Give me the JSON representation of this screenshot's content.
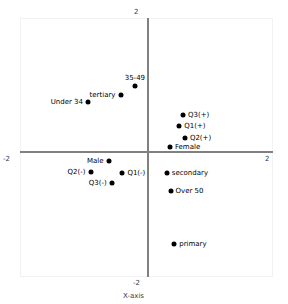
{
  "chart_data": {
    "type": "scatter",
    "title": "",
    "xlabel": "X-axis",
    "ylabel": "Y-axis",
    "xlim": [
      -2,
      2
    ],
    "ylim": [
      -2,
      2
    ],
    "xticks": [
      "-2",
      "2"
    ],
    "yticks": [
      "-2",
      "2"
    ],
    "grid": false,
    "legend": "none",
    "marker_color": "#000000",
    "axis_color": "#808080",
    "points": [
      {
        "label": "35-49",
        "x": -0.21,
        "y": 1.0,
        "label_pos": "above"
      },
      {
        "label": "tertiary",
        "x": -0.44,
        "y": 0.86,
        "label_pos": "left"
      },
      {
        "label": "Under 34",
        "x": -0.96,
        "y": 0.75,
        "label_pos": "left"
      },
      {
        "label": "Q3(+)",
        "x": 0.56,
        "y": 0.55,
        "label_pos": "right"
      },
      {
        "label": "Q1(+)",
        "x": 0.5,
        "y": 0.39,
        "label_pos": "right"
      },
      {
        "label": "Q2(+)",
        "x": 0.59,
        "y": 0.21,
        "label_pos": "right"
      },
      {
        "label": "Female",
        "x": 0.35,
        "y": 0.08,
        "label_pos": "right"
      },
      {
        "label": "Male",
        "x": -0.63,
        "y": -0.14,
        "label_pos": "left"
      },
      {
        "label": "secondary",
        "x": 0.3,
        "y": -0.32,
        "label_pos": "right"
      },
      {
        "label": "Q2(-)",
        "x": -0.92,
        "y": -0.3,
        "label_pos": "left"
      },
      {
        "label": "Q1(-)",
        "x": -0.41,
        "y": -0.32,
        "label_pos": "right"
      },
      {
        "label": "Over 50",
        "x": 0.36,
        "y": -0.58,
        "label_pos": "right"
      },
      {
        "label": "Q3(-)",
        "x": -0.58,
        "y": -0.47,
        "label_pos": "left"
      },
      {
        "label": "primary",
        "x": 0.42,
        "y": -1.38,
        "label_pos": "right"
      }
    ]
  }
}
